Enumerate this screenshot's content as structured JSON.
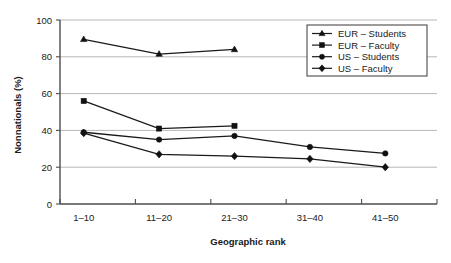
{
  "chart_data": {
    "type": "line",
    "title": "",
    "xlabel": "Geographic rank",
    "ylabel": "Nonnationals (%)",
    "categories": [
      "1–10",
      "11–20",
      "21–30",
      "31–40",
      "41–50"
    ],
    "ytick_labels": [
      "0",
      "20",
      "40",
      "60",
      "80",
      "100"
    ],
    "yticks": [
      0,
      20,
      40,
      60,
      80,
      100
    ],
    "ylim": [
      0,
      100
    ],
    "grid": "horizontal",
    "legend_position": "top-right inside plot",
    "series": [
      {
        "name": "EUR – Students",
        "marker": "triangle",
        "color": "#111111",
        "values": [
          89.5,
          81.5,
          84,
          null,
          null
        ]
      },
      {
        "name": "EUR – Faculty",
        "marker": "square",
        "color": "#111111",
        "values": [
          56,
          41,
          42.5,
          null,
          null
        ]
      },
      {
        "name": "US – Students",
        "marker": "circle",
        "color": "#111111",
        "values": [
          39,
          35,
          37,
          31,
          27.5
        ]
      },
      {
        "name": "US – Faculty",
        "marker": "diamond",
        "color": "#111111",
        "values": [
          38.5,
          27,
          26,
          24.5,
          20
        ]
      }
    ]
  },
  "legend": {
    "entries": [
      {
        "label": "EUR – Students"
      },
      {
        "label": "EUR – Faculty"
      },
      {
        "label": "US – Students"
      },
      {
        "label": "US – Faculty"
      }
    ]
  },
  "colors": {
    "ink": "#111111",
    "grid": "#b8b8b8",
    "axis": "#4d4d4d",
    "background": "#ffffff"
  }
}
